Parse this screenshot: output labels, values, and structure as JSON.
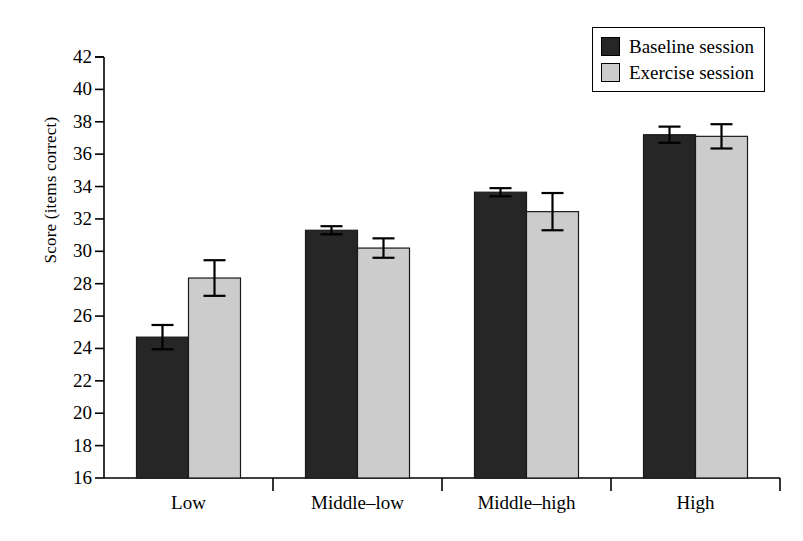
{
  "chart_data": {
    "type": "bar",
    "title": "",
    "xlabel": "",
    "ylabel": "Score (items correct)",
    "categories": [
      "Low",
      "Middle–low",
      "Middle–high",
      "High"
    ],
    "ylim": [
      16,
      42
    ],
    "ytick_step": 2,
    "yticks": [
      16,
      18,
      20,
      22,
      24,
      26,
      28,
      30,
      32,
      34,
      36,
      38,
      40,
      42
    ],
    "grid": false,
    "legend_position": "top-right",
    "series": [
      {
        "name": "Baseline session",
        "color": "#262626",
        "values": [
          24.7,
          31.3,
          33.65,
          37.2
        ],
        "errors": [
          0.75,
          0.25,
          0.25,
          0.5
        ]
      },
      {
        "name": "Exercise session",
        "color": "#cccccc",
        "values": [
          28.35,
          30.2,
          32.45,
          37.1
        ],
        "errors": [
          1.1,
          0.6,
          1.15,
          0.75
        ]
      }
    ]
  },
  "legend": {
    "items": [
      {
        "label": "Baseline session",
        "color": "#262626"
      },
      {
        "label": "Exercise session",
        "color": "#cccccc"
      }
    ]
  },
  "axis": {
    "y_title": "Score (items correct)"
  }
}
